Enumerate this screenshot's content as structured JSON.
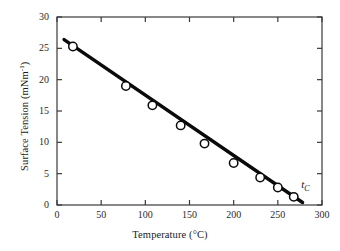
{
  "chart_data": {
    "type": "scatter",
    "title": "",
    "xlabel": "Temperature (°C)",
    "ylabel": "Surface Tension (mNm⁻¹)",
    "ylabel_base": "Surface Tension (mNm",
    "ylabel_sup": "-1",
    "ylabel_tail": ")",
    "xlabel_text": "Temperature (°C)",
    "xlim": [
      0,
      300
    ],
    "ylim": [
      0,
      30
    ],
    "xticks": [
      0,
      50,
      100,
      150,
      200,
      250,
      300
    ],
    "yticks": [
      0,
      5,
      10,
      15,
      20,
      25,
      30
    ],
    "grid": false,
    "legend": "none",
    "frame": "box",
    "tick_direction": "in",
    "series": [
      {
        "name": "surface tension",
        "marker": "open-circle",
        "line": "solid-thick",
        "color": "#0a0a0a",
        "x": [
          18,
          78,
          108,
          140,
          167,
          200,
          230,
          250,
          268
        ],
        "y": [
          25.3,
          19.0,
          15.9,
          12.7,
          9.8,
          6.7,
          4.4,
          2.8,
          1.3
        ]
      }
    ],
    "fit_line": {
      "x": [
        8,
        278
      ],
      "y": [
        26.4,
        0.4
      ]
    },
    "annotations": [
      {
        "name": "critical-temperature-label",
        "text": "tC",
        "symbol": "t",
        "subscript": "C",
        "x": 272,
        "y": 3.1
      }
    ]
  }
}
